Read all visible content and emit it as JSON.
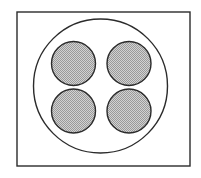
{
  "figure": {
    "type": "technical-line-drawing",
    "canvas": {
      "width": 201,
      "height": 178
    },
    "background_color": "#ffffff",
    "stroke_color": "#2b2b2b",
    "fill_white": "#ffffff",
    "shaded_fill_color": "#c9c9c9",
    "stipple_dot_color": "#8f8f8f",
    "frame": {
      "name": "outer-square",
      "x": 17,
      "y": 12,
      "width": 173,
      "height": 154,
      "stroke_width": 1.4,
      "fill": "#ffffff"
    },
    "enclosing_circle": {
      "name": "large-circle",
      "cx": 100.5,
      "cy": 86,
      "r": 67,
      "stroke_width": 1.4,
      "fill": "#ffffff"
    },
    "inner_circles": [
      {
        "name": "inner-circle-top-left",
        "cx": 73.5,
        "cy": 63.5,
        "r": 22
      },
      {
        "name": "inner-circle-top-right",
        "cx": 129.0,
        "cy": 63.5,
        "r": 22
      },
      {
        "name": "inner-circle-bottom-left",
        "cx": 73.5,
        "cy": 111.0,
        "r": 22
      },
      {
        "name": "inner-circle-bottom-right",
        "cx": 129.0,
        "cy": 111.0,
        "r": 22
      }
    ],
    "inner_circle_count": 4,
    "inner_circle_stroke_width": 1.4
  }
}
